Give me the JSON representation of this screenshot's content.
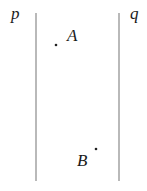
{
  "diagram": {
    "lines": [
      {
        "name": "p",
        "label": "p",
        "x": 36,
        "y1": 13,
        "y2": 181,
        "label_x": 11,
        "label_y": 5
      },
      {
        "name": "q",
        "label": "q",
        "x": 119,
        "y1": 13,
        "y2": 181,
        "label_x": 130,
        "label_y": 5
      }
    ],
    "points": [
      {
        "name": "A",
        "label": "A",
        "x": 56,
        "y": 45,
        "label_x": 67,
        "label_y": 27
      },
      {
        "name": "B",
        "label": "B",
        "x": 96,
        "y": 149,
        "label_x": 77,
        "label_y": 152
      }
    ],
    "colors": {
      "line": "#8a8a8a",
      "point": "#222222",
      "text": "#1a1a1a"
    }
  }
}
